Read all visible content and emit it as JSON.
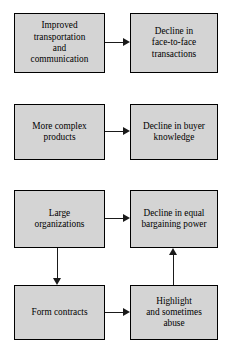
{
  "diagram": {
    "type": "flowchart",
    "orientation": "cause-effect rows, left to right",
    "background_color": "#ffffff",
    "node_fill_color": "#d4d4d4",
    "node_border_color": "#000000",
    "connector_color": "#1a1a1a",
    "nodes": [
      {
        "id": "improved-transportation",
        "label": "Improved\ntransportation\nand\ncommunication",
        "row": 1,
        "column": "left"
      },
      {
        "id": "decline-face-to-face",
        "label": "Decline in\nface-to-face\ntransactions",
        "row": 1,
        "column": "right"
      },
      {
        "id": "more-complex-products",
        "label": "More complex\nproducts",
        "row": 2,
        "column": "left"
      },
      {
        "id": "decline-buyer-knowledge",
        "label": "Decline in buyer\nknowledge",
        "row": 2,
        "column": "right"
      },
      {
        "id": "large-organizations",
        "label": "Large\norganizations",
        "row": 3,
        "column": "left"
      },
      {
        "id": "decline-bargaining-power",
        "label": "Decline in equal\nbargaining power",
        "row": 3,
        "column": "right"
      },
      {
        "id": "form-contracts",
        "label": "Form contracts",
        "row": 4,
        "column": "left"
      },
      {
        "id": "highlight-abuse",
        "label": "Highlight\nand sometimes\nabuse",
        "row": 4,
        "column": "right"
      }
    ],
    "connectors": [
      {
        "id": "c1",
        "from": "improved-transportation",
        "to": "decline-face-to-face",
        "direction": "right"
      },
      {
        "id": "c2",
        "from": "more-complex-products",
        "to": "decline-buyer-knowledge",
        "direction": "right"
      },
      {
        "id": "c3",
        "from": "large-organizations",
        "to": "decline-bargaining-power",
        "direction": "right"
      },
      {
        "id": "c4",
        "from": "large-organizations",
        "to": "form-contracts",
        "direction": "down"
      },
      {
        "id": "c5",
        "from": "form-contracts",
        "to": "highlight-abuse",
        "direction": "right"
      },
      {
        "id": "c6",
        "from": "highlight-abuse",
        "to": "decline-bargaining-power",
        "direction": "up"
      }
    ]
  }
}
